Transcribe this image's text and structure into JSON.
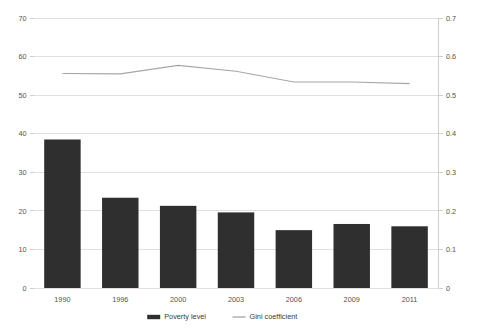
{
  "chart_data": {
    "type": "bar",
    "title": "",
    "subtitle": "",
    "xlabel": "",
    "ylabel": "",
    "grid": true,
    "legend_position": "bottom",
    "categories": [
      "1990",
      "1996",
      "2000",
      "2003",
      "2006",
      "2009",
      "2011"
    ],
    "series": [
      {
        "name": "Poverty level",
        "type": "bar",
        "axis": "left",
        "color": "#2f2f2f",
        "values": [
          38.5,
          23.4,
          21.3,
          19.6,
          15.0,
          16.6,
          16.0
        ]
      },
      {
        "name": "Gini coefficient",
        "type": "line",
        "axis": "right",
        "color": "#a6a6a6",
        "values": [
          0.556,
          0.555,
          0.577,
          0.562,
          0.534,
          0.534,
          0.53
        ]
      }
    ],
    "left_axis": {
      "label": "",
      "ylim": [
        0,
        70
      ],
      "tick_step": 10,
      "ticks": [
        "0",
        "10",
        "20",
        "30",
        "40",
        "50",
        "60",
        "70"
      ]
    },
    "right_axis": {
      "label": "",
      "ylim": [
        0,
        0.7
      ],
      "tick_step": 0.1,
      "ticks": [
        "0",
        "0.1",
        "0.2",
        "0.3",
        "0.4",
        "0.5",
        "0.6",
        "0.7"
      ]
    }
  },
  "legend": {
    "items": [
      {
        "label": "Poverty level",
        "marker": "bar-swatch-icon",
        "color": "#2f2f2f"
      },
      {
        "label": "Gini coefficient",
        "marker": "line-swatch-icon",
        "color": "#a6a6a6"
      }
    ]
  },
  "axis_left_ticks": [
    {
      "value": 70,
      "label": "70"
    },
    {
      "value": 60,
      "label": "60"
    },
    {
      "value": 50,
      "label": "50"
    },
    {
      "value": 40,
      "label": "40"
    },
    {
      "value": 30,
      "label": "30"
    },
    {
      "value": 20,
      "label": "20"
    },
    {
      "value": 10,
      "label": "10"
    },
    {
      "value": 0,
      "label": "0"
    }
  ],
  "axis_right_ticks": [
    {
      "value": 0.7,
      "label": "0.7"
    },
    {
      "value": 0.6,
      "label": "0.6"
    },
    {
      "value": 0.5,
      "label": "0.5"
    },
    {
      "value": 0.4,
      "label": "0.4"
    },
    {
      "value": 0.3,
      "label": "0.3"
    },
    {
      "value": 0.2,
      "label": "0.2"
    },
    {
      "value": 0.1,
      "label": "0.1"
    },
    {
      "value": 0,
      "label": "0"
    }
  ]
}
